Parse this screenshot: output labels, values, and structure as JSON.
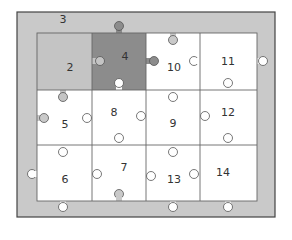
{
  "diagram": {
    "colors": {
      "frame": "#c9c9c9",
      "frame_border": "#444444",
      "piece_default": "#ffffff",
      "piece_light": "#c4c4c4",
      "piece_dark": "#8c8c8c",
      "line": "#555555",
      "text": "#333333"
    },
    "frame_label": "3",
    "pieces": [
      {
        "id": "2",
        "label": "2",
        "row": 0,
        "col": 0,
        "fill": "light"
      },
      {
        "id": "4",
        "label": "4",
        "row": 0,
        "col": 1,
        "fill": "dark"
      },
      {
        "id": "10",
        "label": "10",
        "row": 0,
        "col": 2,
        "fill": "white"
      },
      {
        "id": "11",
        "label": "11",
        "row": 0,
        "col": 3,
        "fill": "white"
      },
      {
        "id": "5",
        "label": "5",
        "row": 1,
        "col": 0,
        "fill": "white"
      },
      {
        "id": "8",
        "label": "8",
        "row": 1,
        "col": 1,
        "fill": "white"
      },
      {
        "id": "9",
        "label": "9",
        "row": 1,
        "col": 2,
        "fill": "white"
      },
      {
        "id": "12",
        "label": "12",
        "row": 1,
        "col": 3,
        "fill": "white"
      },
      {
        "id": "6",
        "label": "6",
        "row": 2,
        "col": 0,
        "fill": "white"
      },
      {
        "id": "7",
        "label": "7",
        "row": 2,
        "col": 1,
        "fill": "white"
      },
      {
        "id": "13",
        "label": "13",
        "row": 2,
        "col": 2,
        "fill": "white"
      },
      {
        "id": "14",
        "label": "14",
        "row": 2,
        "col": 3,
        "fill": "white"
      }
    ]
  }
}
